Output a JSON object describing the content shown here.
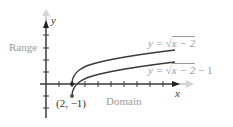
{
  "diagram": {
    "axes": {
      "x_label": "x",
      "y_label": "y"
    },
    "labels": {
      "range": "Range",
      "domain": "Domain",
      "point": "(2, −1)"
    },
    "curves": [
      {
        "name": "upper",
        "label": "y = √x − 2",
        "label_parts": {
          "pre": "y = ",
          "rad": "x − 2",
          "post": ""
        }
      },
      {
        "name": "lower",
        "label": "y = √x − 2 − 1",
        "label_parts": {
          "pre": "y = ",
          "rad": "x − 2",
          "post": " − 1"
        }
      }
    ],
    "colors": {
      "ink": "#333333",
      "axis": "#3a3a3a",
      "arrow_faint": "#cccccc",
      "label_faint": "#9a9a9a"
    }
  }
}
